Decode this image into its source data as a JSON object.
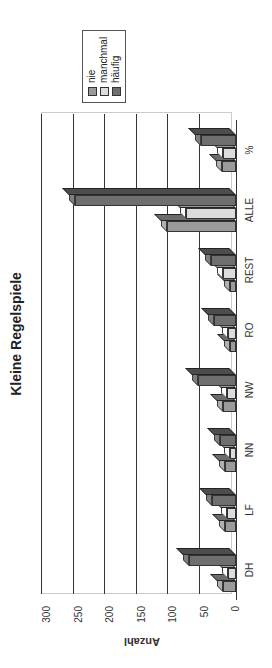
{
  "chart_data": {
    "type": "bar",
    "title": "Kleine Regelspiele",
    "xlabel": "",
    "ylabel": "Anzahl",
    "ylim": [
      0,
      300
    ],
    "yticks": [
      0,
      50,
      100,
      150,
      200,
      250,
      300
    ],
    "categories": [
      "DH",
      "LF",
      "NN",
      "NW",
      "RO",
      "REST",
      "ALLE",
      "%"
    ],
    "series": [
      {
        "name": "nie",
        "color": "#9a9a9a",
        "values": [
          20,
          18,
          18,
          20,
          10,
          10,
          110,
          22
        ]
      },
      {
        "name": "manchmal",
        "color": "#dcdcdc",
        "values": [
          12,
          15,
          10,
          15,
          12,
          20,
          80,
          20
        ]
      },
      {
        "name": "häufig",
        "color": "#6e6e6e",
        "values": [
          75,
          38,
          25,
          60,
          35,
          40,
          255,
          55
        ]
      }
    ],
    "grid": true,
    "legend_position": "right",
    "style": "3d-clustered-column",
    "rotation": "page rotated 90 degrees counterclockwise"
  }
}
